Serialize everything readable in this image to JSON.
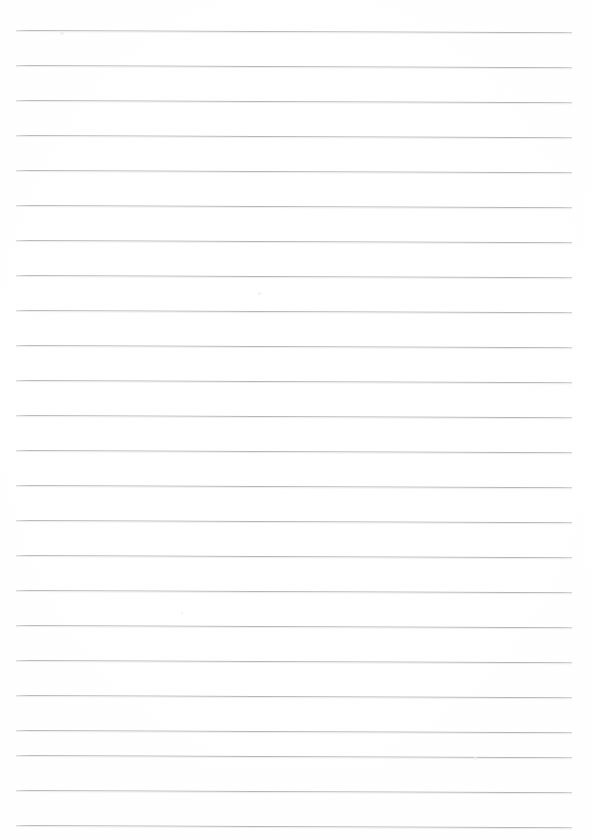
{
  "document": {
    "title": "Blank Ruled Paper",
    "kind": "scanned-lined-notebook-page",
    "page_width": 591,
    "page_height": 840,
    "background_color": "#fefefe",
    "text_content": "",
    "visible_text": ""
  },
  "ruling": {
    "line_color": "#b6b6ba",
    "line_thickness_px": 1,
    "line_spacing_px": 35,
    "first_line_y": 30,
    "line_start_x": 16,
    "line_end_x": 572,
    "line_count": 24,
    "tilt_degrees": 0.22,
    "lines": [
      {
        "index": 1,
        "y": 30
      },
      {
        "index": 2,
        "y": 65
      },
      {
        "index": 3,
        "y": 100
      },
      {
        "index": 4,
        "y": 135
      },
      {
        "index": 5,
        "y": 170
      },
      {
        "index": 6,
        "y": 205
      },
      {
        "index": 7,
        "y": 240
      },
      {
        "index": 8,
        "y": 275
      },
      {
        "index": 9,
        "y": 310
      },
      {
        "index": 10,
        "y": 345
      },
      {
        "index": 11,
        "y": 380
      },
      {
        "index": 12,
        "y": 415
      },
      {
        "index": 13,
        "y": 450
      },
      {
        "index": 14,
        "y": 485
      },
      {
        "index": 15,
        "y": 520
      },
      {
        "index": 16,
        "y": 555
      },
      {
        "index": 17,
        "y": 590
      },
      {
        "index": 18,
        "y": 625
      },
      {
        "index": 19,
        "y": 660
      },
      {
        "index": 20,
        "y": 695
      },
      {
        "index": 21,
        "y": 730
      },
      {
        "index": 22,
        "y": 755
      },
      {
        "index": 23,
        "y": 790
      },
      {
        "index": 24,
        "y": 825
      }
    ]
  },
  "artifacts": {
    "specks": [
      {
        "x": 258,
        "y": 292,
        "size": 3
      },
      {
        "x": 474,
        "y": 757,
        "size": 3
      },
      {
        "x": 181,
        "y": 612,
        "size": 2
      },
      {
        "x": 60,
        "y": 31,
        "size": 4
      }
    ]
  }
}
